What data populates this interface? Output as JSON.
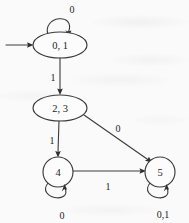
{
  "diagram": {
    "type": "finite-state-machine",
    "background_color": "#fafafa",
    "stroke_color": "#3a3a3a",
    "text_color": "#1d1d1d",
    "start_marker": {
      "name": "start-arrow",
      "target_state": "0, 1"
    },
    "states": [
      {
        "id": "s01",
        "label": "0, 1",
        "shape": "ellipse",
        "cx": 60,
        "cy": 45,
        "rx": 27,
        "ry": 13
      },
      {
        "id": "s23",
        "label": "2, 3",
        "shape": "ellipse",
        "cx": 60,
        "cy": 108,
        "rx": 27,
        "ry": 13
      },
      {
        "id": "s4",
        "label": "4",
        "shape": "circle",
        "cx": 58,
        "cy": 172,
        "rx": 15,
        "ry": 15
      },
      {
        "id": "s5",
        "label": "5",
        "shape": "circle",
        "cx": 160,
        "cy": 172,
        "rx": 15,
        "ry": 15
      }
    ],
    "transitions": [
      {
        "id": "t-s01-self",
        "from": "0, 1",
        "to": "0, 1",
        "label": "0",
        "kind": "self-loop-top",
        "label_x": 72,
        "label_y": 9
      },
      {
        "id": "t-s01-s23",
        "from": "0, 1",
        "to": "2, 3",
        "label": "1",
        "kind": "vertical",
        "label_x": 53,
        "label_y": 77
      },
      {
        "id": "t-s23-s4",
        "from": "2, 3",
        "to": "4",
        "label": "1",
        "kind": "vertical",
        "label_x": 52,
        "label_y": 140
      },
      {
        "id": "t-s23-s5",
        "from": "2, 3",
        "to": "5",
        "label": "0",
        "kind": "diagonal",
        "label_x": 118,
        "label_y": 128
      },
      {
        "id": "t-s4-s5",
        "from": "4",
        "to": "5",
        "label": "1",
        "kind": "horizontal",
        "label_x": 108,
        "label_y": 186
      },
      {
        "id": "t-s4-self",
        "from": "4",
        "to": "4",
        "label": "0",
        "kind": "self-loop-bottom",
        "label_x": 62,
        "label_y": 215
      },
      {
        "id": "t-s5-self",
        "from": "5",
        "to": "5",
        "label": "0,1",
        "kind": "self-loop-bottom",
        "label_x": 163,
        "label_y": 214
      }
    ]
  }
}
